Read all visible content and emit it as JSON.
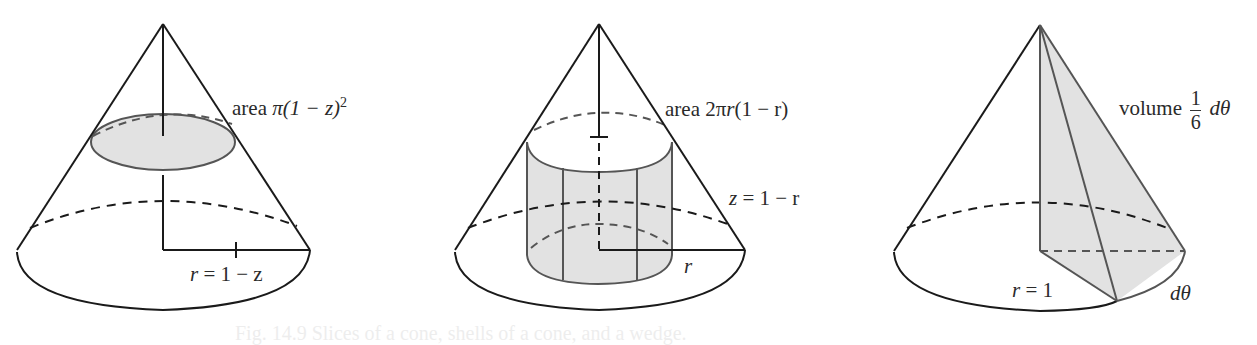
{
  "figures": [
    {
      "id": "slices",
      "label_area": "area",
      "label_area_expr": "π(1 − z)",
      "label_area_exp": "2",
      "label_radius_var": "r",
      "label_radius_expr": "= 1 − z"
    },
    {
      "id": "shells",
      "label_area": "area",
      "label_area_expr_prefix": "2π",
      "label_area_var": "r",
      "label_area_expr_suffix": "(1 − r)",
      "label_height_var": "z",
      "label_height_expr": "= 1 − r",
      "label_radius": "r"
    },
    {
      "id": "wedge",
      "label_volume": "volume",
      "frac_num": "1",
      "frac_den": "6",
      "label_dtheta": "dθ",
      "label_radius_var": "r",
      "label_radius_expr": "= 1",
      "label_arc": "dθ"
    }
  ],
  "caption": "Fig. 14.9 Slices of a cone, shells of a cone, and a wedge.",
  "colors": {
    "stroke": "#1a1a1a",
    "gray_stroke": "#555555",
    "fill": "#e2e2e2",
    "text": "#2a2a2a"
  }
}
